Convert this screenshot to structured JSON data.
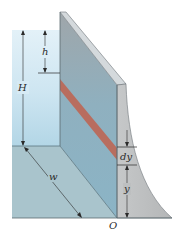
{
  "figure": {
    "labels": {
      "h": "h",
      "H": "H",
      "w": "w",
      "dy": "dy",
      "y": "y",
      "O": "O"
    },
    "colors": {
      "water_light": "#cfe6f2",
      "water_mid": "#b4d6e6",
      "floor": "#a9c4cc",
      "wall_front": "#8fb0bf",
      "wall_top": "#d4d9dc",
      "dam_side": "#bcbcbc",
      "strip": "#c0614e",
      "line": "#2a2a2a"
    }
  }
}
